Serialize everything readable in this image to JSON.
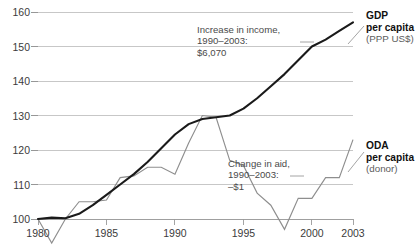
{
  "chart_data": {
    "type": "line",
    "title": "",
    "xlabel": "",
    "ylabel": "",
    "index_note": "Index, 1980 = 100",
    "xlim": [
      1980,
      2003
    ],
    "ylim": [
      100,
      160
    ],
    "yticks": [
      100,
      110,
      120,
      130,
      140,
      150,
      160
    ],
    "xticks": [
      1980,
      1985,
      1990,
      1995,
      2000,
      2003
    ],
    "xtick_labels": [
      "1980",
      "1985",
      "1990",
      "1995",
      "2000",
      "2003"
    ],
    "ytick_labels": [
      "100",
      "110",
      "120",
      "130",
      "140",
      "150",
      "160"
    ],
    "grid": true,
    "legend_position": "right",
    "x": [
      1980,
      1981,
      1982,
      1983,
      1984,
      1985,
      1986,
      1987,
      1988,
      1989,
      1990,
      1991,
      1992,
      1993,
      1994,
      1995,
      1996,
      1997,
      1998,
      1999,
      2000,
      2001,
      2002,
      2003
    ],
    "series": [
      {
        "name": "GDP per capita (PPP US$)",
        "color": "#1a1a1a",
        "values": [
          100,
          100.4,
          100.2,
          101.5,
          104,
          107,
          110,
          113,
          116.5,
          120.5,
          124.5,
          127.5,
          129,
          129.5,
          130,
          132,
          135,
          138.5,
          142,
          146,
          150,
          152,
          154.5,
          157
        ]
      },
      {
        "name": "ODA per capita (donor)",
        "color": "#8e8e8e",
        "values": [
          100,
          93,
          100,
          105,
          105,
          105.5,
          112,
          112.5,
          115,
          115,
          113,
          122,
          130,
          129.5,
          117,
          115.5,
          107.5,
          104,
          97,
          106,
          106,
          112,
          112,
          123
        ]
      }
    ],
    "annotations": [
      {
        "id": "income-annotation",
        "lines": [
          "Increase in income,",
          "1990–2003:",
          "$6,070"
        ]
      },
      {
        "id": "aid-annotation",
        "lines": [
          "Change in aid,",
          "1990–2003:",
          "–$1"
        ]
      }
    ],
    "legend_entries": [
      {
        "id": "gdp",
        "title": "GDP",
        "subtitle": "per capita",
        "detail": "(PPP US$)"
      },
      {
        "id": "oda",
        "title": "ODA",
        "subtitle": "per capita",
        "detail": "(donor)"
      }
    ]
  }
}
